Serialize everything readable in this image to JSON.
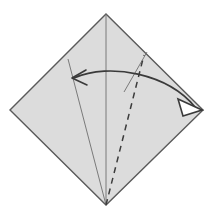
{
  "figure": {
    "title": "Origami fold step diagram",
    "canvas": {
      "width": 213,
      "height": 213,
      "background": "#ffffff"
    }
  },
  "colors": {
    "paper_fill": "#dcdcdc",
    "paper_edge": "#5a5a5a",
    "crease_line": "#6e6e6e",
    "dashed_crease": "#3c3c3c",
    "arrow": "#3a3a3a",
    "background": "#ffffff"
  },
  "paper": {
    "name": "square-sheet-diamond",
    "vertices": {
      "top": [
        106,
        14
      ],
      "right": [
        203,
        110
      ],
      "bottom": [
        106,
        205
      ],
      "left": [
        10,
        110
      ]
    },
    "edge_width": 1.4
  },
  "creases": [
    {
      "name": "center-vertical-crease",
      "style": "solid",
      "from": [
        106,
        14
      ],
      "to": [
        106,
        205
      ],
      "width": 0.9
    },
    {
      "name": "left-diagonal-crease",
      "style": "solid",
      "from": [
        68,
        59
      ],
      "to": [
        106,
        205
      ],
      "width": 0.9
    },
    {
      "name": "short-tick-crease",
      "style": "solid",
      "from": [
        147,
        52
      ],
      "to": [
        124,
        92
      ],
      "width": 0.9
    },
    {
      "name": "dashed-fold-crease",
      "style": "dashed",
      "from": [
        106,
        205
      ],
      "to": [
        144,
        55
      ],
      "width": 1.5,
      "dash_pattern": "6 5"
    }
  ],
  "arrow": {
    "name": "fold-direction-double-arrow",
    "style": "curved-double-headed",
    "path": "M 74 78 C 110 62, 168 74, 195 107",
    "width": 1.6,
    "head_left": {
      "name": "arrowhead-left-open-v",
      "type": "open-v",
      "tip": [
        73,
        78
      ],
      "points": "86 70, 72 78, 87 85"
    },
    "head_right": {
      "name": "arrowhead-right-hollow-triangle",
      "type": "hollow-triangle",
      "tip": [
        202,
        110
      ],
      "points": "202 110, 178 99, 183 116"
    }
  }
}
